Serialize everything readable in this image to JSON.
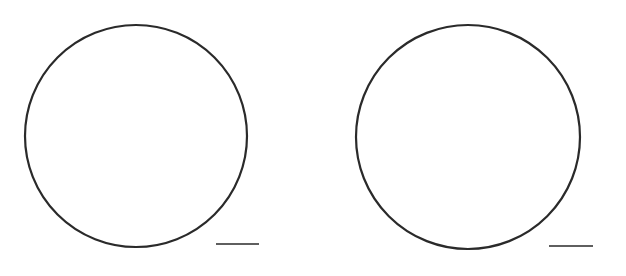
{
  "figure": {
    "background": "#ffffff",
    "stroke_color": "#2a2a2a",
    "panels": [
      {
        "id": "left",
        "circle": {
          "cx": 136,
          "cy": 136,
          "r": 111,
          "stroke_width": 2.2
        },
        "scale_bar": {
          "x1": 216,
          "x2": 259,
          "y": 244,
          "stroke_width": 1.4
        }
      },
      {
        "id": "right",
        "circle": {
          "cx": 468,
          "cy": 137,
          "r": 112,
          "stroke_width": 2.2
        },
        "scale_bar": {
          "x1": 549,
          "x2": 593,
          "y": 246,
          "stroke_width": 1.4
        }
      }
    ]
  }
}
